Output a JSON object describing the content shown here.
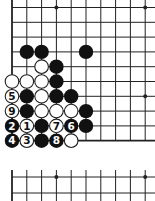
{
  "diagram": {
    "type": "go-board",
    "spacing": 14.8,
    "origin_x": 12,
    "origin_y": 7.5,
    "columns": 10,
    "main_board": {
      "rows": 10,
      "left_edge": true,
      "bottom_edge": true,
      "star_points": [
        [
          3,
          0
        ],
        [
          9,
          0
        ],
        [
          9,
          6
        ]
      ],
      "stones": [
        {
          "col": 1,
          "row": 3,
          "color": "black",
          "label": ""
        },
        {
          "col": 2,
          "row": 3,
          "color": "black",
          "label": ""
        },
        {
          "col": 5,
          "row": 3,
          "color": "black",
          "label": ""
        },
        {
          "col": 2,
          "row": 4,
          "color": "white",
          "label": ""
        },
        {
          "col": 3,
          "row": 4,
          "color": "black",
          "label": ""
        },
        {
          "col": 0,
          "row": 5,
          "color": "white",
          "label": ""
        },
        {
          "col": 1,
          "row": 5,
          "color": "white",
          "label": ""
        },
        {
          "col": 2,
          "row": 5,
          "color": "white",
          "label": ""
        },
        {
          "col": 3,
          "row": 5,
          "color": "black",
          "label": ""
        },
        {
          "col": 0,
          "row": 6,
          "color": "white",
          "label": "5"
        },
        {
          "col": 1,
          "row": 6,
          "color": "black",
          "label": ""
        },
        {
          "col": 2,
          "row": 6,
          "color": "white",
          "label": ""
        },
        {
          "col": 3,
          "row": 6,
          "color": "black",
          "label": ""
        },
        {
          "col": 4,
          "row": 6,
          "color": "black",
          "label": ""
        },
        {
          "col": 0,
          "row": 7,
          "color": "white",
          "label": "9"
        },
        {
          "col": 1,
          "row": 7,
          "color": "black",
          "label": ""
        },
        {
          "col": 2,
          "row": 7,
          "color": "white",
          "label": ""
        },
        {
          "col": 3,
          "row": 7,
          "color": "white",
          "label": ""
        },
        {
          "col": 4,
          "row": 7,
          "color": "white",
          "label": ""
        },
        {
          "col": 5,
          "row": 7,
          "color": "black",
          "label": ""
        },
        {
          "col": 0,
          "row": 8,
          "color": "black",
          "label": "2"
        },
        {
          "col": 1,
          "row": 8,
          "color": "white",
          "label": "1"
        },
        {
          "col": 2,
          "row": 8,
          "color": "black",
          "label": ""
        },
        {
          "col": 3,
          "row": 8,
          "color": "white",
          "label": "7"
        },
        {
          "col": 4,
          "row": 8,
          "color": "black",
          "label": "6"
        },
        {
          "col": 5,
          "row": 8,
          "color": "black",
          "label": ""
        },
        {
          "col": 0,
          "row": 9,
          "color": "black",
          "label": "4"
        },
        {
          "col": 1,
          "row": 9,
          "color": "white",
          "label": "3"
        },
        {
          "col": 2,
          "row": 9,
          "color": "black",
          "label": ""
        },
        {
          "col": 3,
          "row": 9,
          "color": "black",
          "label": "8"
        },
        {
          "col": 4,
          "row": 9,
          "color": "white",
          "label": ""
        }
      ]
    },
    "lower_fragment": {
      "top_y": 170,
      "row_ys": [
        177,
        193
      ],
      "star_points": [
        [
          3,
          0
        ],
        [
          9,
          0
        ]
      ]
    },
    "colors": {
      "line": "#222222",
      "black_stone": "#111111",
      "white_stone": "#ffffff",
      "background": "#ffffff"
    }
  }
}
